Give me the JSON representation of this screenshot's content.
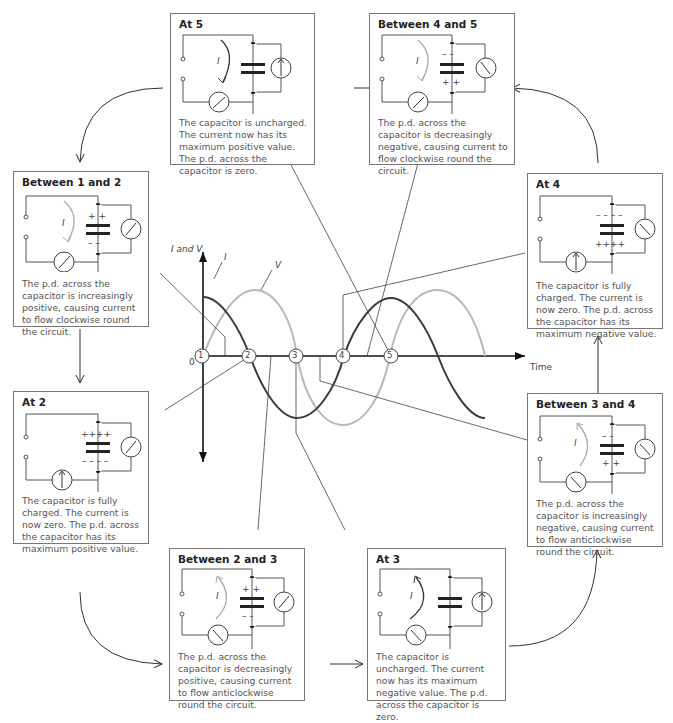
{
  "graph": {
    "y_axis_label": "I and V",
    "x_axis_label": "Time",
    "origin_label": "0",
    "curve_labels": {
      "current": "I",
      "voltage": "V"
    },
    "points": [
      "1",
      "2",
      "3",
      "4",
      "5"
    ]
  },
  "colors": {
    "current_curve": "#333333",
    "voltage_curve": "#b5b5b5",
    "box_border": "#777777"
  },
  "panels": {
    "at5": {
      "title": "At 5",
      "current_symbol": "I",
      "desc": "The capacitor is uncharged. The current now has its maximum positive value. The p.d. across the capacitor is zero."
    },
    "b45": {
      "title": "Between 4 and 5",
      "current_symbol": "I",
      "desc": "The p.d. across the capacitor is decreasingly negative, causing current to flow clockwise round the circuit."
    },
    "b12": {
      "title": "Between 1 and 2",
      "current_symbol": "I",
      "desc": "The p.d. across the capacitor is increasingly positive, causing current to flow clockwise round the circuit."
    },
    "at4": {
      "title": "At 4",
      "desc": "The capacitor is fully charged. The current is now zero. The p.d. across the capacitor has its maximum negative value."
    },
    "at2": {
      "title": "At 2",
      "desc": "The capacitor is fully charged. The current is now zero. The p.d. across the capacitor has its maximum positive value."
    },
    "b34": {
      "title": "Between 3 and 4",
      "current_symbol": "I",
      "desc": "The p.d. across the capacitor is increasingly negative, causing current to flow anticlockwise round the circuit."
    },
    "b23": {
      "title": "Between 2 and 3",
      "current_symbol": "I",
      "desc": "The p.d. across the capacitor is decreasingly positive, causing current to flow anticlockwise round the circuit."
    },
    "at3": {
      "title": "At 3",
      "current_symbol": "I",
      "desc": "The capacitor is uncharged. The current now has its maximum negative value. The p.d. across the capacitor is zero."
    }
  }
}
